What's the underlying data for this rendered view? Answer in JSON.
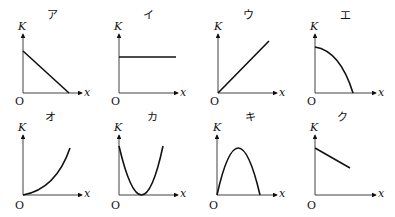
{
  "graphs": [
    {
      "id": "a",
      "title": "ア",
      "y_axis": "K",
      "x_axis": "x",
      "origin": "O",
      "shape": "linear decreasing from positive intercept to zero on x-axis"
    },
    {
      "id": "i",
      "title": "イ",
      "y_axis": "K",
      "x_axis": "x",
      "origin": "O",
      "shape": "constant horizontal line"
    },
    {
      "id": "u",
      "title": "ウ",
      "y_axis": "K",
      "x_axis": "x",
      "origin": "O",
      "shape": "linear increasing from origin"
    },
    {
      "id": "e",
      "title": "エ",
      "y_axis": "K",
      "x_axis": "x",
      "origin": "O",
      "shape": "concave-down curve decreasing from max at x=0 to zero"
    },
    {
      "id": "o",
      "title": "オ",
      "y_axis": "K",
      "x_axis": "x",
      "origin": "O",
      "shape": "concave-up curve increasing from origin"
    },
    {
      "id": "ka",
      "title": "カ",
      "y_axis": "K",
      "x_axis": "x",
      "origin": "O",
      "shape": "upward parabola touching zero at middle"
    },
    {
      "id": "ki",
      "title": "キ",
      "y_axis": "K",
      "x_axis": "x",
      "origin": "O",
      "shape": "downward parabola from origin back to zero"
    },
    {
      "id": "ku",
      "title": "ク",
      "y_axis": "K",
      "x_axis": "x",
      "origin": "O",
      "shape": "linear decreasing, does not reach zero"
    }
  ]
}
